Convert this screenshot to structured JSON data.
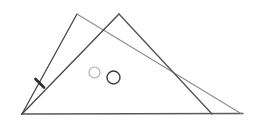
{
  "figure": {
    "background_color": "#ffffff",
    "canvas": {
      "width": 256,
      "height": 127
    },
    "lines": [
      {
        "name": "baseline",
        "x1": 21.5,
        "y1": 114,
        "x2": 243,
        "y2": 113.5,
        "color": "#5a5a5a",
        "width": 1.3
      },
      {
        "name": "triangle-a-left-side",
        "x1": 22,
        "y1": 114,
        "x2": 77,
        "y2": 14,
        "color": "#474747",
        "width": 1.3
      },
      {
        "name": "triangle-a-right-side",
        "x1": 77,
        "y1": 14,
        "x2": 241,
        "y2": 113.5,
        "color": "#8c8c8c",
        "width": 1.1
      },
      {
        "name": "triangle-b-left-side",
        "x1": 119,
        "y1": 14,
        "x2": 22,
        "y2": 114,
        "color": "#474747",
        "width": 1.3
      },
      {
        "name": "triangle-b-right-side",
        "x1": 119,
        "y1": 14,
        "x2": 212,
        "y2": 114,
        "color": "#525252",
        "width": 1.3
      },
      {
        "name": "tick-mark",
        "x1": 35.5,
        "y1": 79,
        "x2": 44,
        "y2": 87.5,
        "color": "#2e2e2e",
        "width": 2.6
      }
    ],
    "circles": [
      {
        "name": "small-circle-left",
        "cx": 94.5,
        "cy": 72.5,
        "r": 5.5,
        "color": "#a9a9a9",
        "width": 1.1
      },
      {
        "name": "small-circle-right",
        "cx": 113.5,
        "cy": 77.5,
        "r": 6.5,
        "color": "#3c3c3c",
        "width": 1.4
      }
    ]
  }
}
